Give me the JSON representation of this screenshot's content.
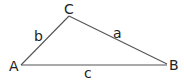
{
  "diagram": {
    "type": "triangle",
    "stroke_color": "#555555",
    "label_color": "#222222",
    "vertices": {
      "A": {
        "label": "A",
        "x": 21,
        "y": 65
      },
      "B": {
        "label": "B",
        "x": 167,
        "y": 64
      },
      "C": {
        "label": "C",
        "x": 69,
        "y": 16
      }
    },
    "sides": {
      "a": {
        "label": "a",
        "from": "B",
        "to": "C"
      },
      "b": {
        "label": "b",
        "from": "A",
        "to": "C"
      },
      "c": {
        "label": "c",
        "from": "A",
        "to": "B"
      }
    }
  }
}
